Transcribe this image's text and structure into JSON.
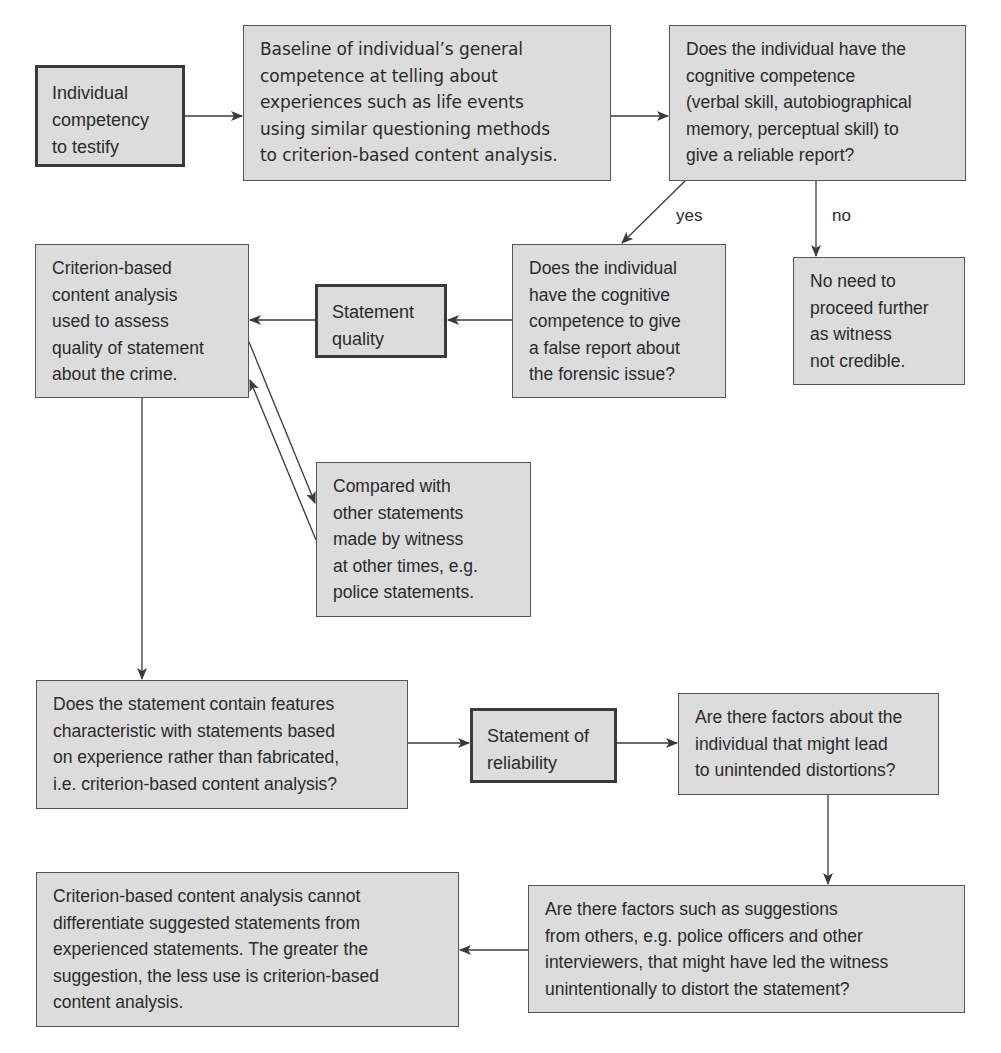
{
  "diagram": {
    "type": "flowchart",
    "nodes": {
      "individual_competency": "Individual\ncompetency\nto testify",
      "baseline": "Baseline of individual’s general\ncompetence at telling about\nexperiences such as life events\nusing similar questioning methods\nto criterion-based content analysis.",
      "cognitive_reliable": "Does the individual have the\ncognitive competence\n(verbal skill, autobiographical\nmemory, perceptual skill) to\ngive a reliable report?",
      "not_credible": "No need to\nproceed further\nas witness\nnot credible.",
      "cognitive_false": "Does the individual\nhave the cognitive\ncompetence to give\na false report about\nthe forensic issue?",
      "statement_quality": "Statement\nquality",
      "cbca_quality": "Criterion-based\ncontent analysis\nused to assess\nquality of statement\nabout the crime.",
      "compared_with": "Compared with\nother statements\nmade by witness\nat other times, e.g.\npolice statements.",
      "features_question": "Does the statement contain features\ncharacteristic with statements based\non experience rather than fabricated,\ni.e. criterion-based content analysis?",
      "statement_reliability": "Statement of\nreliability",
      "individual_factors": "Are there factors about the\nindividual that might lead\nto unintended distortions?",
      "cbca_limitation": "Criterion-based content analysis cannot\ndifferentiate suggested statements from\nexperienced statements. The greater the\nsuggestion, the less use is criterion-based\ncontent analysis.",
      "suggestion_factors": "Are there factors such as suggestions\nfrom others, e.g. police officers and other\ninterviewers, that might have led the witness\nunintentionally to distort the statement?"
    },
    "edge_labels": {
      "yes": "yes",
      "no": "no"
    },
    "edges": [
      {
        "from": "individual_competency",
        "to": "baseline"
      },
      {
        "from": "baseline",
        "to": "cognitive_reliable"
      },
      {
        "from": "cognitive_reliable",
        "to": "cognitive_false",
        "label": "yes"
      },
      {
        "from": "cognitive_reliable",
        "to": "not_credible",
        "label": "no"
      },
      {
        "from": "cognitive_false",
        "to": "statement_quality"
      },
      {
        "from": "statement_quality",
        "to": "cbca_quality"
      },
      {
        "from": "cbca_quality",
        "to": "compared_with"
      },
      {
        "from": "compared_with",
        "to": "cbca_quality"
      },
      {
        "from": "cbca_quality",
        "to": "features_question"
      },
      {
        "from": "features_question",
        "to": "statement_reliability"
      },
      {
        "from": "statement_reliability",
        "to": "individual_factors"
      },
      {
        "from": "individual_factors",
        "to": "suggestion_factors"
      },
      {
        "from": "suggestion_factors",
        "to": "cbca_limitation"
      }
    ],
    "colors": {
      "box_fill": "#dcdcdc",
      "box_border": "#555555",
      "line": "#3a3a3a",
      "text": "#2a2a2a"
    }
  }
}
